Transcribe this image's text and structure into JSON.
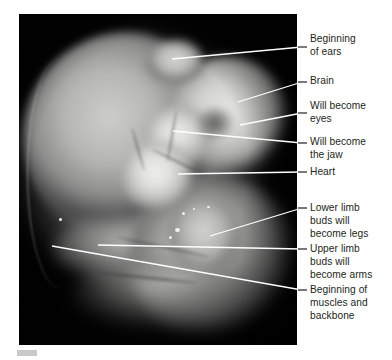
{
  "figure": {
    "plate": {
      "background_color": "#000000",
      "left": 19,
      "top": 14,
      "width": 278,
      "height": 331
    },
    "text_color": "#231f20",
    "leader_line_color": "#ffffff",
    "tab_color": "#c9c9c9"
  },
  "annotations": [
    {
      "id": "beginning-of-ears",
      "label": "Beginning\nof ears",
      "target": "ear bud",
      "leader": {
        "x1": 172,
        "y1": 59,
        "x2": 302,
        "y2": 47
      },
      "text_top": 33
    },
    {
      "id": "brain",
      "label": "Brain",
      "target": "brain vesicle",
      "leader": {
        "x1": 238,
        "y1": 102,
        "x2": 302,
        "y2": 82
      },
      "text_top": 75
    },
    {
      "id": "will-become-eyes",
      "label": "Will become\neyes",
      "target": "optic vesicle",
      "leader": {
        "x1": 240,
        "y1": 125,
        "x2": 302,
        "y2": 113
      },
      "text_top": 100
    },
    {
      "id": "will-become-the-jaw",
      "label": "Will become\nthe jaw",
      "target": "mandibular arch",
      "leader": {
        "x1": 173,
        "y1": 131,
        "x2": 302,
        "y2": 143
      },
      "text_top": 136
    },
    {
      "id": "heart",
      "label": "Heart",
      "target": "heart bulge",
      "leader": {
        "x1": 178,
        "y1": 174,
        "x2": 302,
        "y2": 172
      },
      "text_top": 166
    },
    {
      "id": "lower-limb-buds",
      "label": "Lower limb\nbuds will\nbecome legs",
      "target": "lower limb bud",
      "leader": {
        "x1": 210,
        "y1": 236,
        "x2": 302,
        "y2": 208
      },
      "text_top": 202
    },
    {
      "id": "upper-limb-buds",
      "label": "Upper limb\nbuds will\nbecome arms",
      "target": "upper limb bud",
      "leader": {
        "x1": 98,
        "y1": 245,
        "x2": 302,
        "y2": 249
      },
      "text_top": 243
    },
    {
      "id": "beginning-of-muscles-and-backbone",
      "label": "Beginning of\nmuscles and\nbackbone",
      "target": "somites",
      "leader": {
        "x1": 52,
        "y1": 246,
        "x2": 302,
        "y2": 290
      },
      "text_top": 284
    }
  ]
}
